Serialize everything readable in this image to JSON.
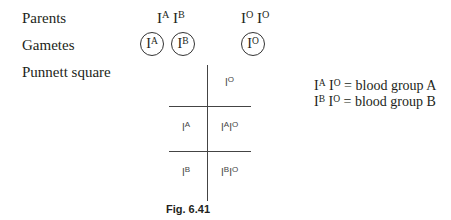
{
  "labels": {
    "parents": "Parents",
    "gametes": "Gametes",
    "punnett": "Punnett square"
  },
  "parents": {
    "parent1": [
      {
        "base": "I",
        "sup": "A"
      },
      {
        "base": "I",
        "sup": "B"
      }
    ],
    "parent2": [
      {
        "base": "I",
        "sup": "O"
      },
      {
        "base": "I",
        "sup": "O"
      }
    ]
  },
  "gametes": [
    {
      "base": "I",
      "sup": "A"
    },
    {
      "base": "I",
      "sup": "B"
    },
    {
      "base": "I",
      "sup": "O"
    }
  ],
  "punnett": {
    "column_header": {
      "base": "I",
      "sup": "O"
    },
    "rows": [
      {
        "header": {
          "base": "I",
          "sup": "A"
        },
        "cell": [
          {
            "base": "I",
            "sup": "A"
          },
          {
            "base": "I",
            "sup": "O"
          }
        ]
      },
      {
        "header": {
          "base": "I",
          "sup": "B"
        },
        "cell": [
          {
            "base": "I",
            "sup": "B"
          },
          {
            "base": "I",
            "sup": "O"
          }
        ]
      }
    ]
  },
  "key": [
    {
      "genotype": [
        {
          "base": "I",
          "sup": "A"
        },
        {
          "base": "I",
          "sup": "O"
        }
      ],
      "text": " = blood group A"
    },
    {
      "genotype": [
        {
          "base": "I",
          "sup": "B"
        },
        {
          "base": "I",
          "sup": "O"
        }
      ],
      "text": " = blood group B"
    }
  ],
  "caption": "Fig. 6.41"
}
